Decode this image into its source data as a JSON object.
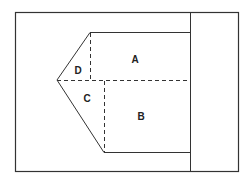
{
  "diagram": {
    "colors": {
      "line": "#333333",
      "background": "#ffffff"
    },
    "frame": {
      "x": 15,
      "y": 12,
      "width": 223,
      "height": 159
    },
    "divider": {
      "x": 190
    },
    "polygon": {
      "top_left": [
        90,
        32
      ],
      "top_right": [
        190,
        32
      ],
      "left_vertex": [
        57,
        80
      ],
      "bottom_left": [
        104,
        152
      ],
      "bottom_right": [
        190,
        152
      ]
    },
    "dashed": {
      "horizontal_y": 80,
      "d_vertical_x": 90,
      "c_vertical_x": 104
    },
    "labels": [
      {
        "id": "A",
        "text": "A",
        "x": 135,
        "y": 63
      },
      {
        "id": "B",
        "text": "B",
        "x": 141,
        "y": 120
      },
      {
        "id": "C",
        "text": "C",
        "x": 87,
        "y": 102
      },
      {
        "id": "D",
        "text": "D",
        "x": 78,
        "y": 74
      }
    ]
  }
}
